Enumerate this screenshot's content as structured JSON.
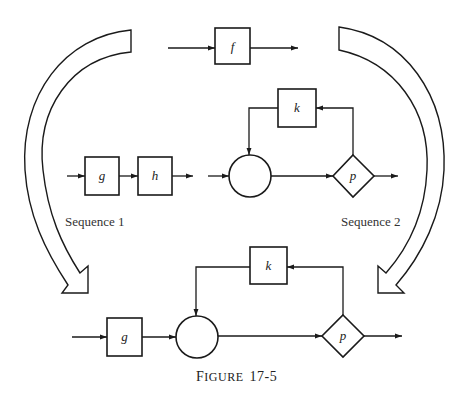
{
  "figure": {
    "caption_first_letter": "F",
    "caption_rest": "IGURE",
    "caption_number": "17-5",
    "caption_full": "Figure 17-5"
  },
  "top": {
    "f_label": "f"
  },
  "sequence1": {
    "label": "Sequence 1",
    "boxes": [
      "g",
      "h"
    ]
  },
  "sequence2": {
    "label": "Sequence 2",
    "k_label": "k",
    "p_label": "p"
  },
  "result": {
    "g_label": "g",
    "k_label": "k",
    "p_label": "p"
  },
  "colors": {
    "line": "#1a1a1a",
    "background": "#ffffff"
  }
}
